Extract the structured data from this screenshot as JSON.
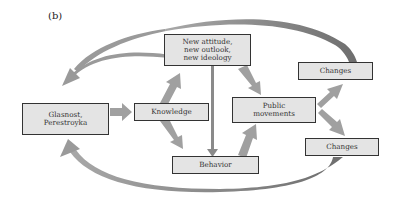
{
  "figure": {
    "panel_label": "(b)",
    "nodes": {
      "glasnost": {
        "lines": [
          "Glasnost,",
          "Perestroyka"
        ]
      },
      "knowledge": {
        "label": "Knowledge"
      },
      "attitude": {
        "lines": [
          "New attitude,",
          "new outlook,",
          "new ideology"
        ]
      },
      "public": {
        "lines": [
          "Public",
          "movements"
        ]
      },
      "behavior": {
        "label": "Behavior"
      },
      "changes_top": {
        "label": "Changes"
      },
      "changes_bottom": {
        "label": "Changes"
      }
    },
    "edges": [
      {
        "from": "Glasnost, Perestroyka",
        "to": "Knowledge"
      },
      {
        "from": "Knowledge",
        "to": "New attitude, new outlook, new ideology"
      },
      {
        "from": "Knowledge",
        "to": "Behavior"
      },
      {
        "from": "New attitude, new outlook, new ideology",
        "to": "Behavior"
      },
      {
        "from": "New attitude, new outlook, new ideology",
        "to": "Public movements"
      },
      {
        "from": "Behavior",
        "to": "Public movements"
      },
      {
        "from": "Public movements",
        "to": "Changes (top)"
      },
      {
        "from": "Public movements",
        "to": "Changes (bottom)"
      },
      {
        "from": "Changes (top)",
        "to": "Glasnost, Perestroyka",
        "style": "curved feedback"
      },
      {
        "from": "Changes (bottom)",
        "to": "Glasnost, Perestroyka",
        "style": "curved feedback"
      }
    ],
    "colors": {
      "box_fill": "#e4e4e4",
      "box_border": "#333333",
      "arrow_fill": "#9a9a9a",
      "arrow_dark": "#7a7a7a"
    }
  }
}
